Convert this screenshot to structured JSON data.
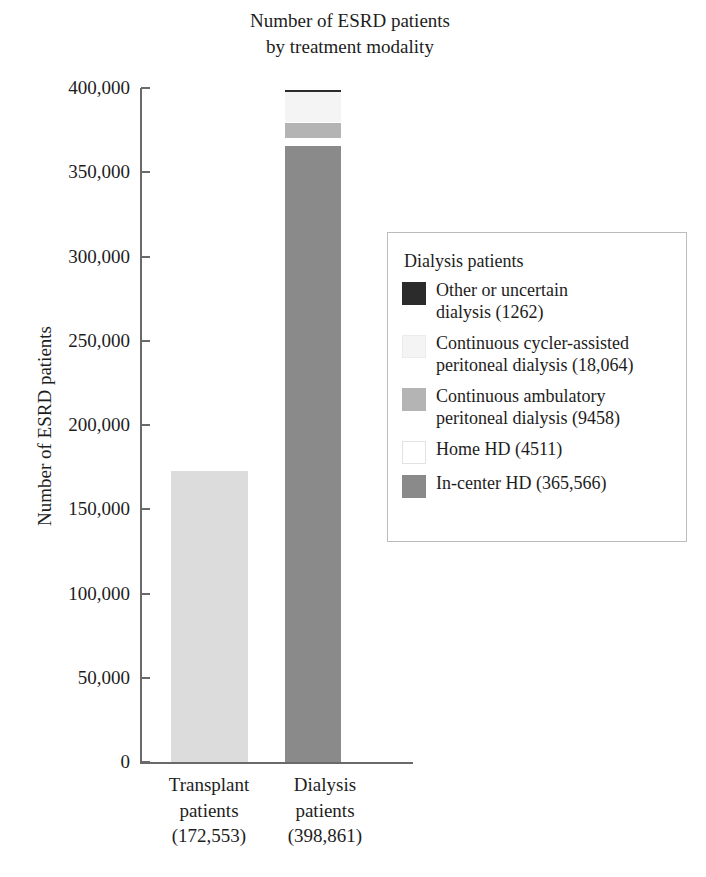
{
  "chart_data": {
    "type": "bar",
    "subtype": "stacked-bar",
    "title": "Number of ESRD patients\nby treatment modality",
    "xlabel": "",
    "ylabel": "Number of ESRD patients",
    "ylim": [
      0,
      400000
    ],
    "ytick_values": [
      0,
      50000,
      100000,
      150000,
      200000,
      250000,
      300000,
      350000,
      400000
    ],
    "ytick_labels": [
      "0",
      "50,000",
      "100,000",
      "150,000",
      "200,000",
      "250,000",
      "300,000",
      "350,000",
      "400,000"
    ],
    "grid": false,
    "legend_position": "right-middle",
    "categories": [
      "Transplant patients",
      "Dialysis patients"
    ],
    "category_labels": [
      "Transplant\npatients\n(172,553)",
      "Dialysis\npatients\n(398,861)"
    ],
    "category_totals": [
      172553,
      398861
    ],
    "category_total_labels": [
      "172,553",
      "398,861"
    ],
    "series": [
      {
        "name": "Transplant patients",
        "values": [
          172553,
          0
        ],
        "color": "#dcdcdc"
      },
      {
        "name": "In-center HD",
        "values": [
          0,
          365566
        ],
        "color": "#8a8a8a"
      },
      {
        "name": "Home HD",
        "values": [
          0,
          4511
        ],
        "color": "#ffffff"
      },
      {
        "name": "Continuous ambulatory peritoneal dialysis",
        "values": [
          0,
          9458
        ],
        "color": "#b4b4b4"
      },
      {
        "name": "Continuous cycler-assisted peritoneal dialysis",
        "values": [
          0,
          18064
        ],
        "color": "#f2f2f2"
      },
      {
        "name": "Other or uncertain dialysis",
        "values": [
          0,
          1262
        ],
        "color": "#2b2b2b"
      }
    ]
  },
  "bars": {
    "transplant": {
      "label": "Transplant\npatients\n(172,553)",
      "segments": [
        {
          "name": "Transplant patients",
          "value": 172553,
          "color": "#dcdcdc"
        }
      ]
    },
    "dialysis": {
      "label": "Dialysis\npatients\n(398,861)",
      "segments": [
        {
          "name": "In-center HD",
          "value": 365566,
          "color": "#8a8a8a"
        },
        {
          "name": "Home HD",
          "value": 4511,
          "color": "#ffffff"
        },
        {
          "name": "Continuous ambulatory peritoneal dialysis",
          "value": 9458,
          "color": "#b4b4b4"
        },
        {
          "name": "Continuous cycler-assisted peritoneal dialysis",
          "value": 18064,
          "color": "#f4f4f4"
        },
        {
          "name": "Other or uncertain dialysis",
          "value": 1262,
          "color": "#2b2b2b"
        }
      ]
    }
  },
  "axis": {
    "y_title": "Number of ESRD patients",
    "ticks": [
      {
        "label": "400,000",
        "value": 400000
      },
      {
        "label": "350,000",
        "value": 350000
      },
      {
        "label": "300,000",
        "value": 300000
      },
      {
        "label": "250,000",
        "value": 250000
      },
      {
        "label": "200,000",
        "value": 200000
      },
      {
        "label": "150,000",
        "value": 150000
      },
      {
        "label": "100,000",
        "value": 100000
      },
      {
        "label": "50,000",
        "value": 50000
      },
      {
        "label": "0",
        "value": 0
      }
    ]
  },
  "legend": {
    "title": "Dialysis patients",
    "items": [
      {
        "label": "Other or uncertain\ndialysis (1262)",
        "color": "#2b2b2b",
        "border": "#2b2b2b"
      },
      {
        "label": "Continuous cycler-assisted\nperitoneal dialysis (18,064)",
        "color": "#f4f4f4",
        "border": "#ececec"
      },
      {
        "label": "Continuous ambulatory\nperitoneal dialysis (9458)",
        "color": "#b4b4b4",
        "border": "#b4b4b4"
      },
      {
        "label": "Home HD (4511)",
        "color": "#ffffff",
        "border": "#e2e2e2"
      },
      {
        "label": "In-center HD (365,566)",
        "color": "#8a8a8a",
        "border": "#8a8a8a"
      }
    ]
  },
  "colors": {
    "axis": "#6a6a6a",
    "text": "#1d1d1d",
    "legend_border": "#bcbcbc",
    "background": "#ffffff"
  }
}
